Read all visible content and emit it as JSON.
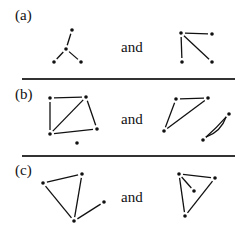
{
  "panels": [
    {
      "label": "(a)",
      "connector": "and",
      "left_graph": {
        "nodes": [
          [
            72,
            30
          ],
          [
            66,
            49
          ],
          [
            54,
            62
          ],
          [
            81,
            62
          ]
        ],
        "edges": [
          [
            0,
            1
          ],
          [
            1,
            2
          ],
          [
            1,
            3
          ]
        ],
        "curved_edges": []
      },
      "right_graph": {
        "nodes": [
          [
            181,
            33
          ],
          [
            212,
            34
          ],
          [
            182,
            62
          ],
          [
            212,
            62
          ]
        ],
        "edges": [
          [
            0,
            1
          ],
          [
            0,
            2
          ],
          [
            0,
            3
          ]
        ],
        "curved_edges": []
      }
    },
    {
      "label": "(b)",
      "connector": "and",
      "left_graph": {
        "nodes": [
          [
            50,
            98
          ],
          [
            86,
            97
          ],
          [
            50,
            134
          ],
          [
            97,
            129
          ],
          [
            77,
            143
          ]
        ],
        "edges": [
          [
            0,
            1
          ],
          [
            0,
            2
          ],
          [
            1,
            2
          ],
          [
            1,
            3
          ],
          [
            2,
            3
          ]
        ],
        "curved_edges": []
      },
      "right_graph": {
        "nodes": [
          [
            176,
            99
          ],
          [
            208,
            98
          ],
          [
            164,
            131
          ],
          [
            229,
            114
          ],
          [
            203,
            140
          ]
        ],
        "edges": [
          [
            0,
            1
          ],
          [
            0,
            2
          ],
          [
            1,
            2
          ],
          [
            3,
            4
          ]
        ],
        "curved_edges": [
          [
            3,
            4
          ]
        ]
      }
    },
    {
      "label": "(c)",
      "connector": "and",
      "left_graph": {
        "nodes": [
          [
            43,
            183
          ],
          [
            82,
            174
          ],
          [
            74,
            221
          ],
          [
            104,
            202
          ]
        ],
        "edges": [
          [
            0,
            1
          ],
          [
            0,
            2
          ],
          [
            1,
            2
          ],
          [
            2,
            3
          ]
        ],
        "curved_edges": []
      },
      "right_graph": {
        "nodes": [
          [
            179,
            174
          ],
          [
            215,
            178
          ],
          [
            194,
            191
          ],
          [
            185,
            216
          ]
        ],
        "edges": [
          [
            0,
            1
          ],
          [
            0,
            3
          ],
          [
            1,
            3
          ],
          [
            0,
            2
          ]
        ],
        "curved_edges": []
      }
    }
  ],
  "colors": {
    "stroke": "#111111",
    "divider": "#333333",
    "background": "#ffffff"
  }
}
